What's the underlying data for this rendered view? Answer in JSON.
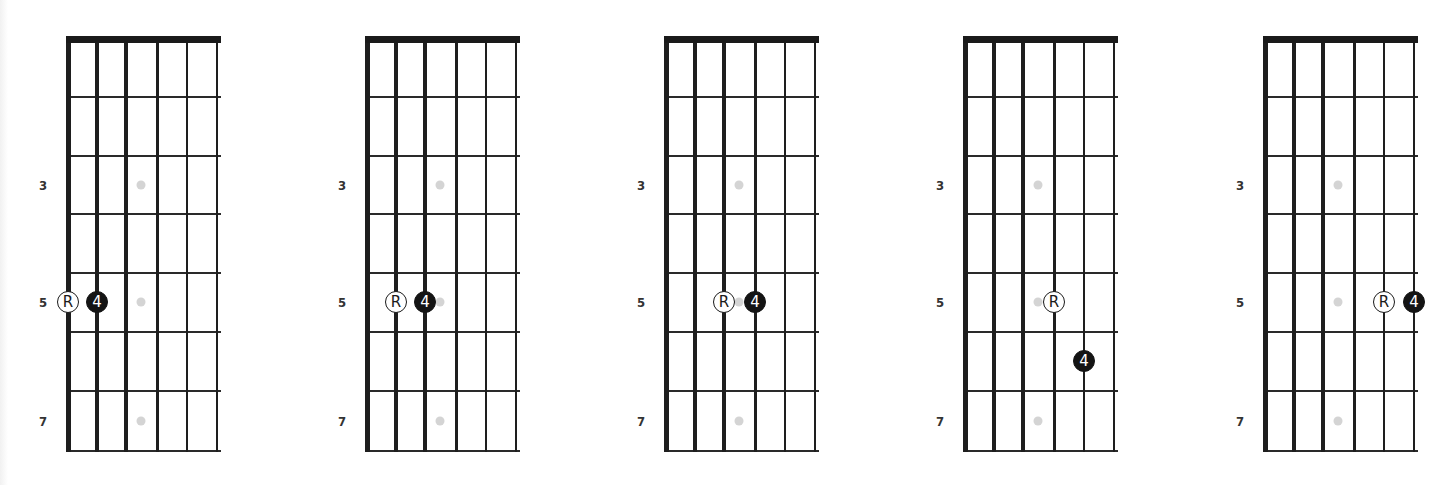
{
  "config": {
    "diagram_x": [
      65,
      364,
      663,
      962,
      1262
    ],
    "string_offsets": [
      3,
      32,
      61,
      92,
      122,
      152
    ],
    "string_widths": [
      5,
      4,
      3.5,
      3,
      2.5,
      2
    ],
    "fret_y": [
      39,
      97,
      156,
      214,
      273,
      332,
      391,
      451
    ],
    "row_centers": [
      68,
      126,
      185,
      244,
      302,
      361,
      421
    ],
    "inlay_rows": [
      3,
      5,
      7
    ],
    "inlay_string_gap": [
      2,
      3
    ],
    "fret_label_x_offset": -22,
    "colors": {
      "line": "#1e1e1e",
      "inlay": "#d4d4d4",
      "root_fill": "#ffffff",
      "interval_fill": "#141414"
    }
  },
  "fret_labels": [
    {
      "row": 3,
      "text": "3"
    },
    {
      "row": 5,
      "text": "5"
    },
    {
      "row": 7,
      "text": "7"
    }
  ],
  "diagrams": [
    {
      "id": "diagram-1",
      "notes": [
        {
          "type": "root",
          "label": "R",
          "string": 1,
          "row": 5
        },
        {
          "type": "interval",
          "label": "4",
          "string": 2,
          "row": 5
        }
      ]
    },
    {
      "id": "diagram-2",
      "notes": [
        {
          "type": "root",
          "label": "R",
          "string": 2,
          "row": 5
        },
        {
          "type": "interval",
          "label": "4",
          "string": 3,
          "row": 5
        }
      ]
    },
    {
      "id": "diagram-3",
      "notes": [
        {
          "type": "root",
          "label": "R",
          "string": 3,
          "row": 5
        },
        {
          "type": "interval",
          "label": "4",
          "string": 4,
          "row": 5
        }
      ]
    },
    {
      "id": "diagram-4",
      "notes": [
        {
          "type": "root",
          "label": "R",
          "string": 4,
          "row": 5
        },
        {
          "type": "interval",
          "label": "4",
          "string": 5,
          "row": 6
        }
      ]
    },
    {
      "id": "diagram-5",
      "notes": [
        {
          "type": "root",
          "label": "R",
          "string": 5,
          "row": 5
        },
        {
          "type": "interval",
          "label": "4",
          "string": 6,
          "row": 5
        }
      ]
    }
  ]
}
